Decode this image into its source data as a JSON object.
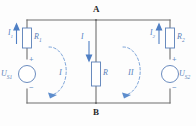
{
  "diagram": {
    "type": "electrical-circuit-schematic",
    "colors": {
      "wire": "#6f6f6f",
      "component_blue": "#5a7fb8",
      "current_arrow": "#4f7fc4",
      "loop_arrow": "#7ba3d8",
      "node_text": "#2b2b2b",
      "background": "#fdfdfd"
    },
    "nodes": [
      {
        "id": "node-a",
        "label": "A",
        "position": "top-center"
      },
      {
        "id": "node-b",
        "label": "B",
        "position": "bottom-center"
      }
    ],
    "resistors": [
      {
        "id": "r1",
        "label": "R",
        "sub": "1",
        "branch": "left",
        "orientation": "vertical"
      },
      {
        "id": "r",
        "label": "R",
        "sub": "",
        "branch": "middle",
        "orientation": "vertical"
      },
      {
        "id": "r2",
        "label": "R",
        "sub": "2",
        "branch": "right",
        "orientation": "vertical"
      }
    ],
    "sources": [
      {
        "id": "us1",
        "label": "U",
        "sub": "S1",
        "branch": "left",
        "symbol": "circle",
        "plus": "+",
        "minus": "−",
        "plus_position": "top",
        "minus_position": "bottom"
      },
      {
        "id": "us2",
        "label": "U",
        "sub": "S2",
        "branch": "right",
        "symbol": "circle",
        "plus": "+",
        "minus": "−",
        "plus_position": "top",
        "minus_position": "bottom"
      }
    ],
    "currents": [
      {
        "id": "i1",
        "label": "I",
        "sub": "1",
        "branch": "left",
        "direction": "up"
      },
      {
        "id": "i",
        "label": "I",
        "sub": "",
        "branch": "middle",
        "direction": "down"
      },
      {
        "id": "i2",
        "label": "I",
        "sub": "2",
        "branch": "right",
        "direction": "up"
      }
    ],
    "meshes": [
      {
        "id": "mesh-1",
        "label": "I",
        "direction": "clockwise",
        "position": "left"
      },
      {
        "id": "mesh-2",
        "label": "II",
        "direction": "clockwise",
        "position": "right"
      }
    ]
  }
}
